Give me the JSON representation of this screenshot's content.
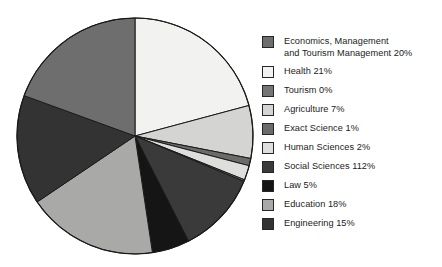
{
  "chart_data": {
    "type": "pie",
    "title": "",
    "subtitle": "",
    "legend_position": "right",
    "grid": false,
    "start_angle_deg": 0,
    "direction": "clockwise",
    "categories": [
      "Economics, Management and Tourism Management",
      "Health",
      "Tourism",
      "Agriculture",
      "Exact Science",
      "Human Sciences",
      "Social Sciences",
      "Law",
      "Education",
      "Engineering"
    ],
    "values": [
      20,
      21,
      0,
      7,
      1,
      2,
      112,
      5,
      18,
      15
    ],
    "value_unit": "%",
    "slice_order_clockwise_from_top": [
      "Health",
      "Agriculture",
      "Exact Science",
      "Human Sciences",
      "Tourism",
      "Social Sciences",
      "Law",
      "Education",
      "Engineering",
      "Economics, Management and Tourism Management"
    ],
    "slice_colors": {
      "Economics, Management and Tourism Management": "#6e6e6e",
      "Health": "#f2f2f0",
      "Tourism": "#757575",
      "Agriculture": "#d4d4d2",
      "Exact Science": "#6b6b6b",
      "Human Sciences": "#dededc",
      "Social Sciences": "#3a3a3a",
      "Law": "#151515",
      "Education": "#a9a9a7",
      "Engineering": "#333333"
    },
    "outline_color": "#1a1a1a"
  },
  "pie": {
    "center_x": 135,
    "center_y": 136,
    "radius": 118,
    "slices": [
      {
        "name": "Health",
        "label": "Health 21%",
        "start_deg": 0,
        "end_deg": 75.0,
        "fill": "#f2f2f0"
      },
      {
        "name": "Agriculture",
        "label": "Agriculture 7%",
        "start_deg": 75.0,
        "end_deg": 101.0,
        "fill": "#d4d4d2"
      },
      {
        "name": "Exact Science",
        "label": "Exact Science 1%",
        "start_deg": 101.0,
        "end_deg": 104.6,
        "fill": "#6b6b6b"
      },
      {
        "name": "Human Sciences",
        "label": "Human Sciences 2%",
        "start_deg": 104.6,
        "end_deg": 111.8,
        "fill": "#dededc"
      },
      {
        "name": "Tourism",
        "label": "Tourism 0%",
        "start_deg": 111.8,
        "end_deg": 112.6,
        "fill": "#757575"
      },
      {
        "name": "Social Sciences",
        "label": "Social Sciences 112%",
        "start_deg": 112.6,
        "end_deg": 153.0,
        "fill": "#3a3a3a"
      },
      {
        "name": "Law",
        "label": "Law 5%",
        "start_deg": 153.0,
        "end_deg": 171.5,
        "fill": "#151515"
      },
      {
        "name": "Education",
        "label": "Education 18%",
        "start_deg": 171.5,
        "end_deg": 236.0,
        "fill": "#a9a9a7"
      },
      {
        "name": "Engineering",
        "label": "Engineering 15%",
        "start_deg": 236.0,
        "end_deg": 290.0,
        "fill": "#333333"
      },
      {
        "name": "Economics, Management and Tourism Management",
        "label": "Economics, Management and Tourism Management 20%",
        "start_deg": 290.0,
        "end_deg": 360.0,
        "fill": "#6e6e6e"
      }
    ]
  },
  "legend": {
    "items": [
      {
        "label": "Economics, Management\nand Tourism Management 20%",
        "color": "#6e6e6e",
        "swatch_name": "legend-swatch-economics"
      },
      {
        "label": "Health 21%",
        "color": "#f2f2f0",
        "swatch_name": "legend-swatch-health"
      },
      {
        "label": "Tourism 0%",
        "color": "#757575",
        "swatch_name": "legend-swatch-tourism"
      },
      {
        "label": "Agriculture 7%",
        "color": "#d4d4d2",
        "swatch_name": "legend-swatch-agriculture"
      },
      {
        "label": "Exact Science 1%",
        "color": "#6b6b6b",
        "swatch_name": "legend-swatch-exact-science"
      },
      {
        "label": "Human Sciences 2%",
        "color": "#dededc",
        "swatch_name": "legend-swatch-human-sciences"
      },
      {
        "label": "Social Sciences 112%",
        "color": "#3a3a3a",
        "swatch_name": "legend-swatch-social-sciences"
      },
      {
        "label": "Law 5%",
        "color": "#151515",
        "swatch_name": "legend-swatch-law"
      },
      {
        "label": "Education 18%",
        "color": "#a9a9a7",
        "swatch_name": "legend-swatch-education"
      },
      {
        "label": "Engineering 15%",
        "color": "#333333",
        "swatch_name": "legend-swatch-engineering"
      }
    ]
  }
}
